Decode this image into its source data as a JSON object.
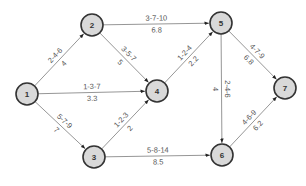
{
  "diagram": {
    "type": "activity-network",
    "colors": {
      "node_fill": "#d9d9d9",
      "node_stroke": "#333333",
      "edge": "#8a8a8a",
      "label": "#555555"
    },
    "nodes": [
      {
        "id": "1",
        "label": "1",
        "x": 27,
        "y": 94
      },
      {
        "id": "2",
        "label": "2",
        "x": 92,
        "y": 25
      },
      {
        "id": "3",
        "label": "3",
        "x": 94,
        "y": 157
      },
      {
        "id": "4",
        "label": "4",
        "x": 157,
        "y": 91
      },
      {
        "id": "5",
        "label": "5",
        "x": 221,
        "y": 23
      },
      {
        "id": "6",
        "label": "6",
        "x": 222,
        "y": 155
      },
      {
        "id": "7",
        "label": "7",
        "x": 285,
        "y": 88
      }
    ],
    "edges": [
      {
        "from": "1",
        "to": "2",
        "estimates": "2-4-6",
        "expected": "4"
      },
      {
        "from": "1",
        "to": "4",
        "estimates": "1-3-7",
        "expected": "3.3"
      },
      {
        "from": "1",
        "to": "3",
        "estimates": "5-7-9",
        "expected": "7"
      },
      {
        "from": "2",
        "to": "5",
        "estimates": "3-7-10",
        "expected": "6.8"
      },
      {
        "from": "2",
        "to": "4",
        "estimates": "3-5-7",
        "expected": "5"
      },
      {
        "from": "3",
        "to": "4",
        "estimates": "1-2-3",
        "expected": "2"
      },
      {
        "from": "3",
        "to": "6",
        "estimates": "5-8-14",
        "expected": "8.5"
      },
      {
        "from": "4",
        "to": "5",
        "estimates": "1-2-4",
        "expected": "2.2"
      },
      {
        "from": "5",
        "to": "6",
        "estimates": "2-4-6",
        "expected": "4"
      },
      {
        "from": "5",
        "to": "7",
        "estimates": "4-7-9",
        "expected": "6.8"
      },
      {
        "from": "6",
        "to": "7",
        "estimates": "4-6-9",
        "expected": "6.2"
      }
    ]
  }
}
